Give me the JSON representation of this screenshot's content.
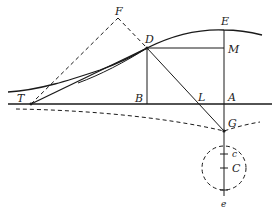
{
  "diagram": {
    "type": "geometric-construction",
    "points": {
      "T": {
        "label": "T",
        "x": 31,
        "y": 104
      },
      "F": {
        "label": "F",
        "x": 118,
        "y": 18
      },
      "D": {
        "label": "D",
        "x": 147,
        "y": 48
      },
      "B": {
        "label": "B",
        "x": 147,
        "y": 104
      },
      "E": {
        "label": "E",
        "x": 224,
        "y": 30
      },
      "M": {
        "label": "M",
        "x": 224,
        "y": 48
      },
      "L": {
        "label": "L",
        "x": 195,
        "y": 104
      },
      "A": {
        "label": "A",
        "x": 224,
        "y": 104
      },
      "G": {
        "label": "G",
        "x": 224,
        "y": 131
      },
      "c": {
        "label": "c",
        "x": 224,
        "y": 154
      },
      "C": {
        "label": "C",
        "x": 224,
        "y": 168
      },
      "e": {
        "label": "e",
        "x": 224,
        "y": 190
      }
    },
    "labels": {
      "T": "T",
      "F": "F",
      "D": "D",
      "B": "B",
      "E": "E",
      "M": "M",
      "L": "L",
      "A": "A",
      "G": "G",
      "c": "c",
      "C": "C",
      "e": "e"
    },
    "elements": [
      {
        "kind": "line",
        "style": "solid",
        "from": "baseline-left",
        "to": "baseline-right",
        "desc": "horizontal axis through T, B, L, A"
      },
      {
        "kind": "curve",
        "style": "solid",
        "desc": "upper curve through D with vertex at E"
      },
      {
        "kind": "line",
        "style": "solid",
        "from": "T",
        "to": "D",
        "desc": "tangent TD"
      },
      {
        "kind": "line",
        "style": "dashed",
        "from": "T",
        "to": "F"
      },
      {
        "kind": "line",
        "style": "dashed",
        "from": "F",
        "to": "D"
      },
      {
        "kind": "line",
        "style": "solid",
        "from": "D",
        "to": "B"
      },
      {
        "kind": "line",
        "style": "solid",
        "from": "D",
        "to": "M"
      },
      {
        "kind": "line",
        "style": "solid",
        "from": "D",
        "to": "G",
        "desc": "normal DG through L"
      },
      {
        "kind": "line",
        "style": "solid",
        "from": "E",
        "to": "e",
        "desc": "vertical axis"
      },
      {
        "kind": "curve",
        "style": "dashed",
        "desc": "lower dashed curve through G"
      },
      {
        "kind": "circle",
        "style": "dashed",
        "center": "C",
        "radius": 22
      }
    ],
    "colors": {
      "ink": "#1a1a1a",
      "background": "#ffffff"
    }
  }
}
